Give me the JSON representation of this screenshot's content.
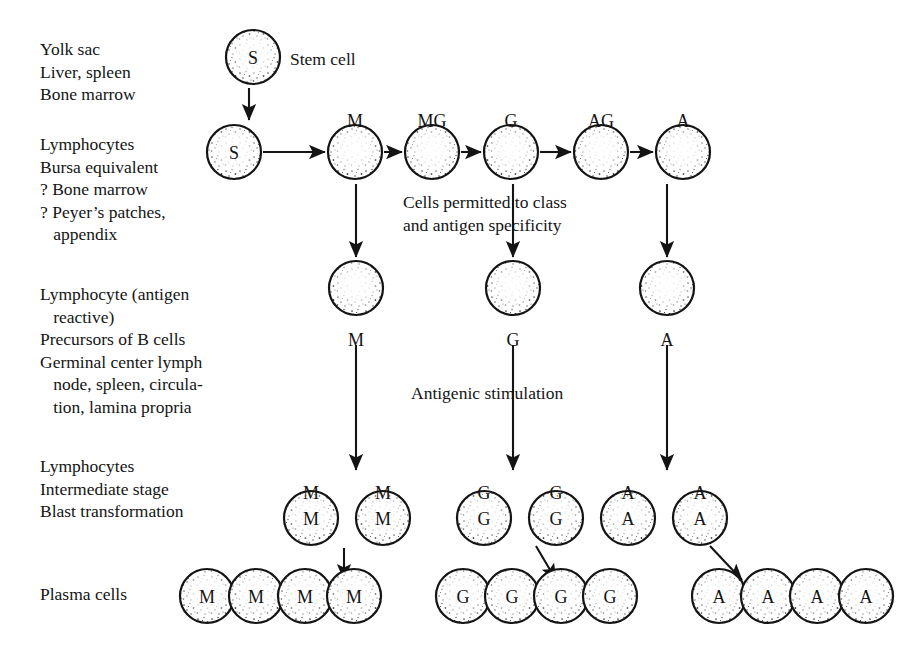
{
  "diagram": {
    "colors": {
      "ink": "#141414",
      "cell_fill": "#ffffff",
      "stipple": "#2a2a2a",
      "background": "#ffffff"
    },
    "stage_labels": [
      {
        "id": "stage-origin",
        "x": 40,
        "y": 38,
        "text": "Yolk sac\nLiver, spleen\nBone marrow"
      },
      {
        "id": "stage-lymphocytes",
        "x": 40,
        "y": 133,
        "text": "Lymphocytes\nBursa equivalent\n? Bone marrow\n? Peyer’s patches,\n   appendix"
      },
      {
        "id": "stage-antigen-reactive",
        "x": 40,
        "y": 283,
        "text": "Lymphocyte (antigen\n   reactive)\nPrecursors of B cells\nGerminal center lymph\n   node, spleen, circula-\n   tion, lamina propria"
      },
      {
        "id": "stage-intermediate",
        "x": 40,
        "y": 455,
        "text": "Lymphocytes\nIntermediate stage\nBlast transformation"
      },
      {
        "id": "stage-plasma",
        "x": 40,
        "y": 583,
        "text": "Plasma cells"
      }
    ],
    "annotations": [
      {
        "id": "annot-stem-cell",
        "x": 290,
        "y": 48,
        "text": "Stem cell"
      },
      {
        "id": "annot-permitted",
        "x": 403,
        "y": 191,
        "text": "Cells permitted to class\nand antigen specificity"
      },
      {
        "id": "annot-antigenic",
        "x": 411,
        "y": 382,
        "text": "Antigenic stimulation"
      }
    ],
    "rows": {
      "row1_stem": {
        "name": "stem-cell-row",
        "cells": [
          {
            "cx": 253,
            "cy": 57,
            "r": 27,
            "letter": "S"
          }
        ]
      },
      "row2_committed": {
        "name": "committed-precursor-row",
        "labels_above": [
          {
            "cx": 355,
            "y": 112,
            "text": "M"
          },
          {
            "cx": 432,
            "y": 112,
            "text": "MG"
          },
          {
            "cx": 511,
            "y": 112,
            "text": "G"
          },
          {
            "cx": 601,
            "y": 112,
            "text": "AG"
          },
          {
            "cx": 683,
            "y": 112,
            "text": "A"
          }
        ],
        "cells": [
          {
            "cx": 234,
            "cy": 152,
            "r": 27,
            "letter": "S"
          },
          {
            "cx": 355,
            "cy": 152,
            "r": 27,
            "letter": ""
          },
          {
            "cx": 432,
            "cy": 152,
            "r": 27,
            "letter": ""
          },
          {
            "cx": 511,
            "cy": 152,
            "r": 27,
            "letter": ""
          },
          {
            "cx": 601,
            "cy": 152,
            "r": 27,
            "letter": ""
          },
          {
            "cx": 683,
            "cy": 152,
            "r": 27,
            "letter": ""
          }
        ]
      },
      "row3_antigen_reactive": {
        "name": "antigen-reactive-row",
        "cells": [
          {
            "cx": 356,
            "cy": 288,
            "r": 27,
            "letter": ""
          },
          {
            "cx": 513,
            "cy": 288,
            "r": 27,
            "letter": ""
          },
          {
            "cx": 667,
            "cy": 288,
            "r": 27,
            "letter": ""
          }
        ],
        "labels_below": [
          {
            "cx": 356,
            "y": 331,
            "text": "M"
          },
          {
            "cx": 513,
            "y": 331,
            "text": "G"
          },
          {
            "cx": 667,
            "y": 331,
            "text": "A"
          }
        ]
      },
      "row4_intermediate": {
        "name": "intermediate-blast-row",
        "labels_above": [
          {
            "cx": 311,
            "y": 484,
            "text": "M"
          },
          {
            "cx": 383,
            "y": 484,
            "text": "M"
          },
          {
            "cx": 484,
            "y": 484,
            "text": "G"
          },
          {
            "cx": 556,
            "y": 484,
            "text": "G"
          },
          {
            "cx": 628,
            "y": 484,
            "text": "A"
          },
          {
            "cx": 700,
            "y": 484,
            "text": "A"
          }
        ],
        "cells": [
          {
            "cx": 311,
            "cy": 518,
            "r": 27,
            "letter": "M"
          },
          {
            "cx": 383,
            "cy": 518,
            "r": 27,
            "letter": "M"
          },
          {
            "cx": 484,
            "cy": 518,
            "r": 27,
            "letter": "G"
          },
          {
            "cx": 556,
            "cy": 518,
            "r": 27,
            "letter": "G"
          },
          {
            "cx": 628,
            "cy": 518,
            "r": 27,
            "letter": "A"
          },
          {
            "cx": 700,
            "cy": 518,
            "r": 27,
            "letter": "A"
          }
        ]
      },
      "row5_plasma": {
        "name": "plasma-cell-row",
        "cells": [
          {
            "cx": 207,
            "cy": 596,
            "r": 27,
            "letter": "M"
          },
          {
            "cx": 256,
            "cy": 596,
            "r": 27,
            "letter": "M"
          },
          {
            "cx": 305,
            "cy": 596,
            "r": 27,
            "letter": "M"
          },
          {
            "cx": 354,
            "cy": 596,
            "r": 27,
            "letter": "M"
          },
          {
            "cx": 463,
            "cy": 596,
            "r": 27,
            "letter": "G"
          },
          {
            "cx": 512,
            "cy": 596,
            "r": 27,
            "letter": "G"
          },
          {
            "cx": 561,
            "cy": 596,
            "r": 27,
            "letter": "G"
          },
          {
            "cx": 610,
            "cy": 596,
            "r": 27,
            "letter": "G"
          },
          {
            "cx": 719,
            "cy": 596,
            "r": 27,
            "letter": "A"
          },
          {
            "cx": 768,
            "cy": 596,
            "r": 27,
            "letter": "A"
          },
          {
            "cx": 817,
            "cy": 596,
            "r": 27,
            "letter": "A"
          },
          {
            "cx": 866,
            "cy": 596,
            "r": 27,
            "letter": "A"
          }
        ]
      }
    },
    "arrows": [
      {
        "id": "arrow-stem-to-lymph",
        "x1": 249,
        "y1": 88,
        "x2": 249,
        "y2": 120
      },
      {
        "id": "arrow-s-to-m",
        "x1": 263,
        "y1": 152,
        "x2": 325,
        "y2": 152
      },
      {
        "id": "arrow-m-to-mg",
        "x1": 384,
        "y1": 152,
        "x2": 402,
        "y2": 152
      },
      {
        "id": "arrow-mg-to-g",
        "x1": 461,
        "y1": 152,
        "x2": 481,
        "y2": 152
      },
      {
        "id": "arrow-g-to-ag",
        "x1": 540,
        "y1": 152,
        "x2": 571,
        "y2": 152
      },
      {
        "id": "arrow-ag-to-a",
        "x1": 630,
        "y1": 152,
        "x2": 653,
        "y2": 152
      },
      {
        "id": "arrow-m-down",
        "x1": 356,
        "y1": 184,
        "x2": 356,
        "y2": 257
      },
      {
        "id": "arrow-g-down",
        "x1": 513,
        "y1": 184,
        "x2": 513,
        "y2": 257
      },
      {
        "id": "arrow-a-down",
        "x1": 667,
        "y1": 184,
        "x2": 667,
        "y2": 257
      },
      {
        "id": "arrow-m-to-blast",
        "x1": 356,
        "y1": 345,
        "x2": 356,
        "y2": 470
      },
      {
        "id": "arrow-g-to-blast",
        "x1": 513,
        "y1": 345,
        "x2": 513,
        "y2": 470
      },
      {
        "id": "arrow-a-to-blast",
        "x1": 667,
        "y1": 345,
        "x2": 667,
        "y2": 470
      },
      {
        "id": "arrow-blastm-to-plasma",
        "x1": 344,
        "y1": 548,
        "x2": 344,
        "y2": 580
      },
      {
        "id": "arrow-blastg-to-plasma",
        "x1": 536,
        "y1": 546,
        "x2": 556,
        "y2": 580
      },
      {
        "id": "arrow-blasta-to-plasma",
        "x1": 710,
        "y1": 546,
        "x2": 742,
        "y2": 580
      }
    ]
  }
}
